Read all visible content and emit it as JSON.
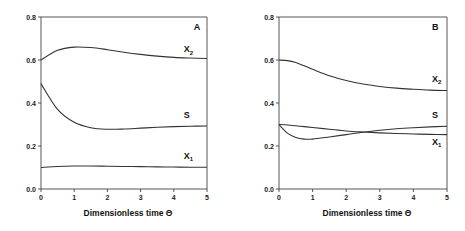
{
  "chart_data": [
    {
      "type": "line",
      "panel_label": "A",
      "xlabel": "Dimensionless time Θ",
      "ylabel": "",
      "xlim": [
        0,
        5
      ],
      "ylim": [
        0,
        0.8
      ],
      "xticks": [
        "0",
        "1",
        "2",
        "3",
        "4",
        "5"
      ],
      "yticks": [
        "0.0",
        "0.2",
        "0.4",
        "0.6",
        "0.8"
      ],
      "x": [
        0,
        0.5,
        1,
        1.5,
        2,
        2.5,
        3,
        3.5,
        4,
        4.5,
        5
      ],
      "series": [
        {
          "name": "X2",
          "label_main": "X",
          "label_sub": "2",
          "values": [
            0.6,
            0.645,
            0.66,
            0.658,
            0.648,
            0.636,
            0.626,
            0.618,
            0.612,
            0.609,
            0.607
          ]
        },
        {
          "name": "S",
          "label_main": "S",
          "label_sub": "",
          "values": [
            0.49,
            0.37,
            0.31,
            0.285,
            0.278,
            0.279,
            0.283,
            0.287,
            0.29,
            0.292,
            0.293
          ]
        },
        {
          "name": "X1",
          "label_main": "X",
          "label_sub": "1",
          "values": [
            0.1,
            0.105,
            0.107,
            0.107,
            0.106,
            0.105,
            0.104,
            0.103,
            0.102,
            0.101,
            0.101
          ]
        }
      ],
      "label_positions": {
        "X2": [
          4.3,
          0.635
        ],
        "S": [
          4.3,
          0.33
        ],
        "X1": [
          4.3,
          0.14
        ],
        "panel": [
          4.6,
          0.74
        ]
      }
    },
    {
      "type": "line",
      "panel_label": "B",
      "xlabel": "Dimensionless time Θ",
      "ylabel": "",
      "xlim": [
        0,
        5
      ],
      "ylim": [
        0,
        0.8
      ],
      "xticks": [
        "0",
        "1",
        "2",
        "3",
        "4",
        "5"
      ],
      "yticks": [
        "0.0",
        "0.2",
        "0.4",
        "0.6",
        "0.8"
      ],
      "x": [
        0,
        0.25,
        0.5,
        0.75,
        1,
        1.5,
        2,
        2.5,
        3,
        3.5,
        4,
        4.5,
        5
      ],
      "series": [
        {
          "name": "X2",
          "label_main": "X",
          "label_sub": "2",
          "values": [
            0.6,
            0.597,
            0.588,
            0.573,
            0.557,
            0.527,
            0.505,
            0.488,
            0.477,
            0.469,
            0.464,
            0.46,
            0.458
          ]
        },
        {
          "name": "S",
          "label_main": "S",
          "label_sub": "",
          "values": [
            0.3,
            0.26,
            0.24,
            0.232,
            0.232,
            0.242,
            0.253,
            0.264,
            0.273,
            0.28,
            0.285,
            0.289,
            0.292
          ]
        },
        {
          "name": "X1",
          "label_main": "X",
          "label_sub": "1",
          "values": [
            0.3,
            0.298,
            0.294,
            0.29,
            0.286,
            0.278,
            0.27,
            0.265,
            0.261,
            0.258,
            0.256,
            0.254,
            0.253
          ]
        }
      ],
      "label_positions": {
        "X2": [
          4.55,
          0.5
        ],
        "S": [
          4.55,
          0.33
        ],
        "X1": [
          4.55,
          0.205
        ],
        "panel": [
          4.55,
          0.74
        ]
      }
    }
  ]
}
